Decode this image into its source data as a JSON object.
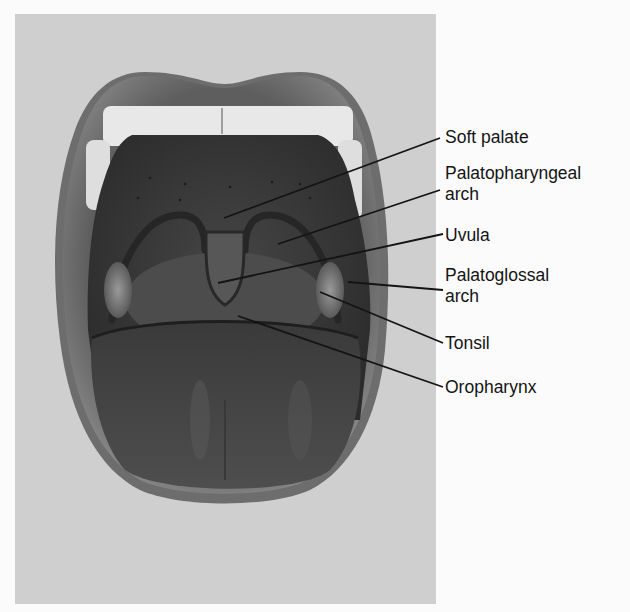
{
  "figure": {
    "colors": {
      "panel_background": "#cfcfcf",
      "lips": "#7a7a7a",
      "oral_cavity": "#3a3a3a",
      "teeth": "#f0f0f0",
      "tongue": "#4a4a4a",
      "leader_lines": "#141414",
      "label_text": "#141414"
    },
    "labels": [
      {
        "id": "soft-palate",
        "line1": "Soft palate",
        "line2": ""
      },
      {
        "id": "palatopharyngeal-arch",
        "line1": "Palatopharyngeal",
        "line2": "arch"
      },
      {
        "id": "uvula",
        "line1": "Uvula",
        "line2": ""
      },
      {
        "id": "palatoglossal-arch",
        "line1": "Palatoglossal",
        "line2": "arch"
      },
      {
        "id": "tonsil",
        "line1": "Tonsil",
        "line2": ""
      },
      {
        "id": "oropharynx",
        "line1": "Oropharynx",
        "line2": ""
      }
    ]
  }
}
